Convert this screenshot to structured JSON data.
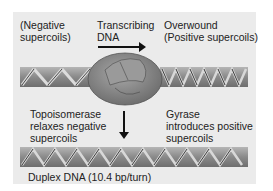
{
  "labels": {
    "negative": [
      "(Negative",
      "supercoils)"
    ],
    "transcribing": [
      "Transcribing",
      "DNA"
    ],
    "overwound": [
      "Overwound",
      "(Positive supercoils)"
    ],
    "topoisomerase": [
      "Topoisomerase",
      "relaxes negative",
      "supercoils"
    ],
    "gyrase": [
      "Gyrase",
      "introduces positive",
      "supercoils"
    ],
    "duplex": "Duplex DNA (10.4 bp/turn)"
  },
  "colors": {
    "panel_bg": "#ebebeb",
    "dna_strand": "#8a8a8a",
    "rna_polymerase": "#8c8c8c",
    "text": "#222222"
  }
}
